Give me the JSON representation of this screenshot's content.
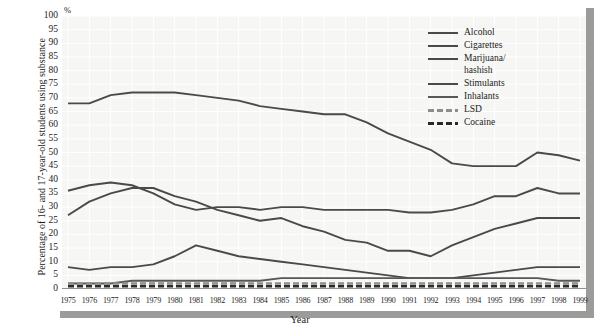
{
  "axis": {
    "ylabel": "Percentage of 16- and 17-year-old students\nusing substance",
    "xlabel": "Year",
    "percent_symbol": "%"
  },
  "legend": {
    "items": [
      {
        "label": "Alcohol",
        "color": "#4a4a4a",
        "style": "solid"
      },
      {
        "label": "Cigarettes",
        "color": "#4a4a4a",
        "style": "solid"
      },
      {
        "label": "Marijuana/\nhashish",
        "color": "#4a4a4a",
        "style": "solid"
      },
      {
        "label": "Stimulants",
        "color": "#4a4a4a",
        "style": "solid"
      },
      {
        "label": "Inhalants",
        "color": "#585858",
        "style": "solid"
      },
      {
        "label": "LSD",
        "color": "#8d8d8d",
        "style": "dashed"
      },
      {
        "label": "Cocaine",
        "color": "#2a2a2a",
        "style": "dashed"
      }
    ]
  },
  "chart_data": {
    "type": "line",
    "title": "",
    "xlabel": "Year",
    "ylabel": "Percentage of 16- and 17-year-old students using substance",
    "xlim": [
      1975,
      1999
    ],
    "ylim": [
      0,
      100
    ],
    "ytick_step": 5,
    "yticks": [
      0,
      5,
      10,
      15,
      20,
      25,
      30,
      35,
      40,
      45,
      50,
      55,
      60,
      65,
      70,
      75,
      80,
      85,
      90,
      95,
      100
    ],
    "grid": true,
    "legend_position": "top-right",
    "categories": [
      1975,
      1976,
      1977,
      1978,
      1979,
      1980,
      1981,
      1982,
      1983,
      1984,
      1985,
      1986,
      1987,
      1988,
      1989,
      1990,
      1991,
      1992,
      1993,
      1994,
      1995,
      1996,
      1997,
      1998,
      1999
    ],
    "series": [
      {
        "name": "Alcohol",
        "color": "#4a4a4a",
        "style": "solid",
        "values": [
          68,
          68,
          71,
          72,
          72,
          72,
          71,
          70,
          69,
          67,
          66,
          65,
          64,
          64,
          61,
          57,
          54,
          51,
          46,
          45,
          45,
          45,
          50,
          49,
          47
        ]
      },
      {
        "name": "Cigarettes",
        "color": "#4a4a4a",
        "style": "solid",
        "values": [
          36,
          38,
          39,
          38,
          35,
          31,
          29,
          30,
          30,
          29,
          30,
          30,
          29,
          29,
          29,
          29,
          28,
          28,
          29,
          31,
          34,
          34,
          37,
          35,
          35
        ]
      },
      {
        "name": "Marijuana/hashish",
        "color": "#4a4a4a",
        "style": "solid",
        "values": [
          27,
          32,
          35,
          37,
          37,
          34,
          32,
          29,
          27,
          25,
          26,
          23,
          21,
          18,
          17,
          14,
          14,
          12,
          16,
          19,
          22,
          24,
          26,
          26,
          26
        ]
      },
      {
        "name": "Stimulants",
        "color": "#4a4a4a",
        "style": "solid",
        "values": [
          8,
          7,
          8,
          8,
          9,
          12,
          16,
          14,
          12,
          11,
          10,
          9,
          8,
          7,
          6,
          5,
          4,
          4,
          4,
          5,
          6,
          7,
          8,
          8,
          8
        ]
      },
      {
        "name": "Inhalants",
        "color": "#585858",
        "style": "solid",
        "values": [
          2,
          2,
          2,
          3,
          3,
          3,
          3,
          3,
          3,
          3,
          4,
          4,
          4,
          4,
          4,
          4,
          4,
          4,
          4,
          4,
          4,
          4,
          4,
          3,
          3
        ]
      },
      {
        "name": "LSD",
        "color": "#8d8d8d",
        "style": "dashed",
        "values": [
          2,
          2,
          2,
          2,
          2,
          2,
          2,
          2,
          2,
          2,
          2,
          2,
          2,
          2,
          2,
          2,
          2,
          2,
          2,
          2,
          2,
          2,
          2,
          2,
          2
        ]
      },
      {
        "name": "Cocaine",
        "color": "#2a2a2a",
        "style": "dashed",
        "values": [
          1,
          1,
          1,
          1,
          1,
          1,
          1,
          1,
          1,
          1,
          1,
          1,
          1,
          1,
          1,
          1,
          1,
          1,
          1,
          1,
          1,
          1,
          1,
          1,
          1
        ]
      }
    ]
  }
}
